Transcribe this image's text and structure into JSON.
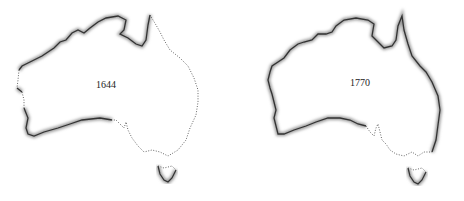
{
  "maps": [
    {
      "year": "1644",
      "description": "Australia outline; charted coastline solid (west, north, Gulf, part of south), uncharted dotted (east coast, south-east, Tasmania north)"
    },
    {
      "year": "1770",
      "description": "Australia outline; charted coastline solid (west, north, south, east), uncharted dotted (south-east, Tasmania north)"
    }
  ],
  "colors": {
    "charted": "#333333",
    "uncharted": "#555555",
    "shadow": "#999999",
    "land": "#ffffff"
  }
}
